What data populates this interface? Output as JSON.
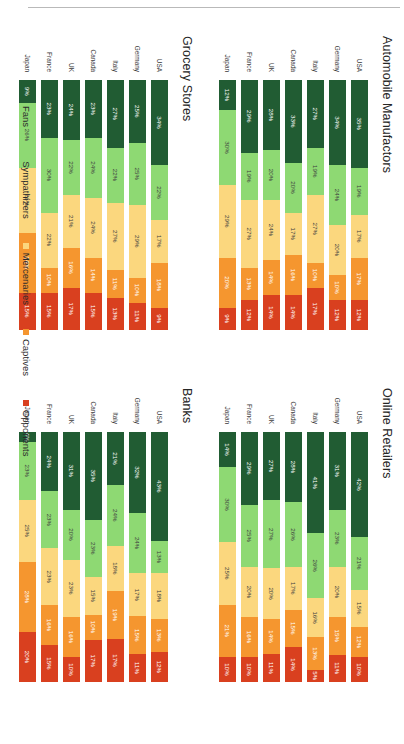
{
  "legend": {
    "position": "bottom",
    "items": [
      {
        "label": "Fans",
        "color": "#215c33"
      },
      {
        "label": "Sympathizers",
        "color": "#8ed973"
      },
      {
        "label": "Mercenaries",
        "color": "#fbd77e"
      },
      {
        "label": "Captives",
        "color": "#f5962f"
      },
      {
        "label": "Opponents",
        "color": "#d9401f"
      }
    ]
  },
  "categories": [
    "USA",
    "Germany",
    "Italy",
    "Canada",
    "UK",
    "France",
    "Japan"
  ],
  "chart_data": [
    {
      "type": "bar",
      "stacked": true,
      "orientation": "horizontal",
      "title": "Automobile  Manufactors",
      "xlabel": "",
      "ylabel": "",
      "xlim": [
        0,
        100
      ],
      "grid": false,
      "categories": [
        "USA",
        "Germany",
        "Italy",
        "Canada",
        "UK",
        "France",
        "Japan"
      ],
      "series": [
        {
          "name": "Fans",
          "values": [
            35,
            34,
            27,
            33,
            28,
            29,
            12
          ]
        },
        {
          "name": "Sympathizers",
          "values": [
            19,
            24,
            19,
            20,
            20,
            19,
            30
          ]
        },
        {
          "name": "Mercenaries",
          "values": [
            17,
            20,
            27,
            17,
            24,
            27,
            29
          ]
        },
        {
          "name": "Captives",
          "values": [
            17,
            10,
            10,
            16,
            14,
            13,
            20
          ]
        },
        {
          "name": "Opponents",
          "values": [
            12,
            12,
            17,
            14,
            14,
            12,
            9
          ]
        }
      ]
    },
    {
      "type": "bar",
      "stacked": true,
      "orientation": "horizontal",
      "title": "Grocery Stores",
      "xlabel": "",
      "ylabel": "",
      "xlim": [
        0,
        100
      ],
      "grid": false,
      "categories": [
        "USA",
        "Germany",
        "Italy",
        "Canada",
        "UK",
        "France",
        "Japan"
      ],
      "series": [
        {
          "name": "Fans",
          "values": [
            34,
            25,
            27,
            23,
            24,
            23,
            9
          ]
        },
        {
          "name": "Sympathizers",
          "values": [
            22,
            25,
            22,
            24,
            22,
            30,
            26
          ]
        },
        {
          "name": "Mercenaries",
          "values": [
            17,
            29,
            27,
            24,
            21,
            22,
            26
          ]
        },
        {
          "name": "Captives",
          "values": [
            18,
            10,
            11,
            14,
            16,
            10,
            24
          ]
        },
        {
          "name": "Opponents",
          "values": [
            9,
            11,
            13,
            15,
            17,
            15,
            15
          ]
        }
      ]
    },
    {
      "type": "bar",
      "stacked": true,
      "orientation": "horizontal",
      "title": "Online Retailers",
      "xlabel": "",
      "ylabel": "",
      "xlim": [
        0,
        100
      ],
      "grid": false,
      "categories": [
        "USA",
        "Germany",
        "Italy",
        "Canada",
        "UK",
        "France",
        "Japan"
      ],
      "series": [
        {
          "name": "Fans",
          "values": [
            42,
            31,
            41,
            28,
            27,
            29,
            14
          ]
        },
        {
          "name": "Sympathizers",
          "values": [
            21,
            23,
            26,
            26,
            27,
            25,
            30
          ]
        },
        {
          "name": "Mercenaries",
          "values": [
            15,
            20,
            16,
            17,
            20,
            20,
            25
          ]
        },
        {
          "name": "Captives",
          "values": [
            12,
            15,
            13,
            15,
            14,
            16,
            21
          ]
        },
        {
          "name": "Opponents",
          "values": [
            10,
            11,
            5,
            14,
            11,
            10,
            10
          ]
        }
      ]
    },
    {
      "type": "bar",
      "stacked": true,
      "orientation": "horizontal",
      "title": "Banks",
      "xlabel": "",
      "ylabel": "",
      "xlim": [
        0,
        100
      ],
      "grid": false,
      "categories": [
        "USA",
        "Germany",
        "Italy",
        "Canada",
        "UK",
        "France",
        "Japan"
      ],
      "series": [
        {
          "name": "Fans",
          "values": [
            43,
            32,
            21,
            35,
            31,
            24,
            4
          ]
        },
        {
          "name": "Sympathizers",
          "values": [
            13,
            24,
            24,
            23,
            20,
            23,
            23
          ]
        },
        {
          "name": "Mercenaries",
          "values": [
            18,
            17,
            18,
            15,
            23,
            23,
            25
          ]
        },
        {
          "name": "Captives",
          "values": [
            13,
            15,
            19,
            10,
            16,
            16,
            28
          ]
        },
        {
          "name": "Opponents",
          "values": [
            12,
            11,
            17,
            17,
            10,
            15,
            20
          ]
        }
      ]
    }
  ]
}
